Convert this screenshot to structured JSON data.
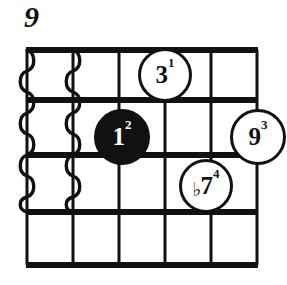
{
  "diagram": {
    "type": "guitar-chord-diagram",
    "position_marker": "9",
    "strings_count": 6,
    "frets_count": 4,
    "colors": {
      "ink": "#111111",
      "paper": "#ffffff"
    },
    "grid": {
      "string_x": [
        27,
        73,
        119,
        165,
        211,
        257
      ],
      "fret_y": [
        50,
        100,
        155,
        212,
        265
      ],
      "thick_fret_lines": [
        0,
        1,
        2,
        3,
        4
      ],
      "top_line_is_thick": true
    },
    "muted_strings": {
      "label": "wavy-damped-strings",
      "strings": [
        1,
        2
      ],
      "from_fret": 1,
      "to_fret": 3
    },
    "markers": [
      {
        "id": "marker-third",
        "degree": "3",
        "finger": "1",
        "accidental": "",
        "string": 4,
        "fret": 1,
        "filled": false,
        "cx": 165,
        "cy": 75,
        "r": 27
      },
      {
        "id": "marker-root",
        "degree": "1",
        "finger": "2",
        "accidental": "",
        "string": 3,
        "fret": 2,
        "filled": true,
        "cx": 122,
        "cy": 137,
        "r": 28
      },
      {
        "id": "marker-ninth",
        "degree": "9",
        "finger": "3",
        "accidental": "",
        "string": 6,
        "fret": 2,
        "filled": false,
        "cx": 258,
        "cy": 137,
        "r": 28
      },
      {
        "id": "marker-flat-seventh",
        "degree": "7",
        "finger": "4",
        "accidental": "♭",
        "string": 5,
        "fret": 3,
        "filled": false,
        "cx": 206,
        "cy": 186,
        "r": 27
      }
    ]
  }
}
